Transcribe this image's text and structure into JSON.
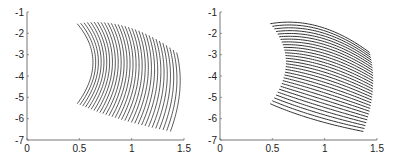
{
  "chart_data": [
    {
      "type": "line",
      "title": "",
      "description": "Family of curves of constant first parameter (vertical-ish curves), densely packed near top",
      "xlabel": "",
      "ylabel": "",
      "xlim": [
        0,
        1.5
      ],
      "ylim": [
        -7,
        -1
      ],
      "xticks": [
        "0",
        "0.5",
        "1",
        "1.5"
      ],
      "yticks": [
        "-1",
        "-2",
        "-3",
        "-4",
        "-5",
        "-6",
        "-7"
      ],
      "grid": false,
      "num_curves": 30,
      "line_color": "#111111",
      "corners": {
        "top_left": [
          0.48,
          -1.55
        ],
        "top_apex": [
          0.75,
          -1.35
        ],
        "right_mid": [
          1.45,
          -3.8
        ],
        "bottom_right": [
          1.37,
          -6.6
        ],
        "bottom_left": [
          0.48,
          -5.3
        ],
        "left_inner": [
          0.7,
          -3.5
        ]
      }
    },
    {
      "type": "line",
      "title": "",
      "description": "Family of curves of constant second parameter (horizontal-ish curves)",
      "xlabel": "",
      "ylabel": "",
      "xlim": [
        0,
        1.5
      ],
      "ylim": [
        -7,
        -1
      ],
      "xticks": [
        "0",
        "0.5",
        "1",
        "1.5"
      ],
      "yticks": [
        "-1",
        "-2",
        "-3",
        "-4",
        "-5",
        "-6",
        "-7"
      ],
      "grid": false,
      "num_curves": 30,
      "line_color": "#333333",
      "corners": {
        "top_left": [
          0.48,
          -1.55
        ],
        "top_apex": [
          0.75,
          -1.35
        ],
        "right_mid": [
          1.45,
          -3.8
        ],
        "bottom_right": [
          1.37,
          -6.6
        ],
        "bottom_left": [
          0.48,
          -5.3
        ],
        "left_inner": [
          0.7,
          -3.5
        ]
      }
    }
  ],
  "panels": [
    {
      "x0": 27,
      "x1": 184,
      "ytop": 12,
      "ybot": 140
    },
    {
      "x0": 220,
      "x1": 377,
      "ytop": 12,
      "ybot": 140
    }
  ]
}
